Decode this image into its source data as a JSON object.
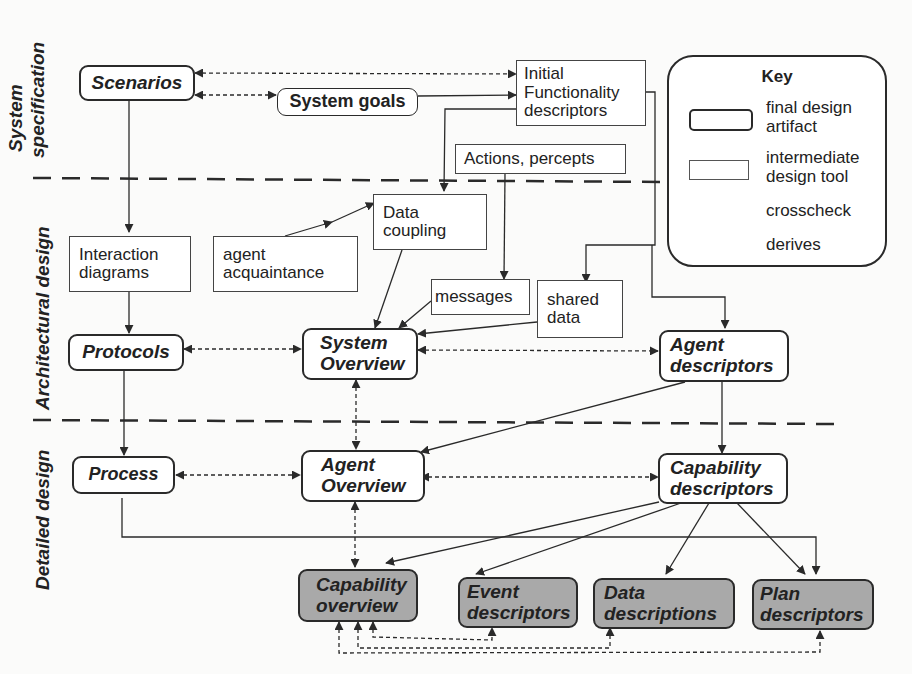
{
  "phases": [
    {
      "id": "system-specification",
      "label_line1": "System",
      "label_line2": "specification"
    },
    {
      "id": "architectural-design",
      "label": "Architectural design"
    },
    {
      "id": "detailed-design",
      "label": "Detailed design"
    }
  ],
  "nodes": {
    "scenarios": {
      "label": "Scenarios",
      "type": "final design artifact"
    },
    "system_goals": {
      "label": "System goals",
      "type": "final design artifact"
    },
    "initial_functionality": {
      "line1": "Initial",
      "line2": "Functionality",
      "line3": "descriptors",
      "type": "intermediate design tool"
    },
    "actions_percepts": {
      "label": "Actions, percepts",
      "type": "intermediate design tool"
    },
    "interaction_diagrams": {
      "line1": "Interaction",
      "line2": "diagrams",
      "type": "intermediate design tool"
    },
    "agent_acquaintance": {
      "line1": "agent",
      "line2": "acquaintance",
      "type": "intermediate design tool"
    },
    "data_coupling": {
      "line1": "Data",
      "line2": "coupling",
      "type": "intermediate design tool"
    },
    "messages": {
      "label": "messages",
      "type": "intermediate design tool"
    },
    "shared_data": {
      "line1": "shared",
      "line2": "data",
      "type": "intermediate design tool"
    },
    "protocols": {
      "label": "Protocols",
      "type": "final design artifact"
    },
    "system_overview": {
      "line1": "System",
      "line2": "Overview",
      "type": "final design artifact"
    },
    "agent_descriptors": {
      "line1": "Agent",
      "line2": "descriptors",
      "type": "final design artifact"
    },
    "process": {
      "label": "Process",
      "type": "final design artifact"
    },
    "agent_overview": {
      "line1": "Agent",
      "line2": "Overview",
      "type": "final design artifact"
    },
    "capability_descriptors": {
      "line1": "Capability",
      "line2": "descriptors",
      "type": "final design artifact"
    },
    "capability_overview": {
      "line1": "Capability",
      "line2": "overview",
      "type": "final design artifact",
      "shaded": true
    },
    "event_descriptors": {
      "line1": "Event",
      "line2": "descriptors",
      "type": "final design artifact",
      "shaded": true
    },
    "data_descriptions": {
      "line1": "Data",
      "line2": "descriptions",
      "type": "final design artifact",
      "shaded": true
    },
    "plan_descriptors": {
      "line1": "Plan",
      "line2": "descriptors",
      "type": "final design artifact",
      "shaded": true
    }
  },
  "key": {
    "title": "Key",
    "final_line1": "final design",
    "final_line2": "artifact",
    "inter_line1": "intermediate",
    "inter_line2": "design tool",
    "crosscheck": "crosscheck",
    "derives": "derives"
  },
  "edges": {
    "derives": [
      [
        "Scenarios",
        "Interaction diagrams"
      ],
      [
        "System goals",
        "Initial Functionality descriptors"
      ],
      [
        "Initial Functionality descriptors",
        "Data coupling"
      ],
      [
        "Initial Functionality descriptors",
        "shared data"
      ],
      [
        "Initial Functionality descriptors",
        "Agent descriptors"
      ],
      [
        "Actions, percepts",
        "messages"
      ],
      [
        "Data coupling",
        "agent acquaintance"
      ],
      [
        "agent acquaintance",
        "Data coupling"
      ],
      [
        "Data coupling",
        "System Overview"
      ],
      [
        "messages",
        "System Overview"
      ],
      [
        "shared data",
        "System Overview"
      ],
      [
        "Interaction diagrams",
        "Protocols"
      ],
      [
        "Protocols",
        "Process"
      ],
      [
        "Agent descriptors",
        "Agent Overview"
      ],
      [
        "Agent descriptors",
        "Capability descriptors"
      ],
      [
        "Process",
        "Plan descriptors"
      ],
      [
        "Capability descriptors",
        "Capability overview"
      ],
      [
        "Capability descriptors",
        "Event descriptors"
      ],
      [
        "Capability descriptors",
        "Data descriptions"
      ],
      [
        "Capability descriptors",
        "Plan descriptors"
      ]
    ],
    "crosscheck": [
      [
        "Scenarios",
        "Initial Functionality descriptors"
      ],
      [
        "Scenarios",
        "System goals"
      ],
      [
        "Protocols",
        "System Overview"
      ],
      [
        "System Overview",
        "Agent descriptors"
      ],
      [
        "System Overview",
        "Agent Overview"
      ],
      [
        "Process",
        "Agent Overview"
      ],
      [
        "Agent Overview",
        "Capability descriptors"
      ],
      [
        "Agent Overview",
        "Capability overview"
      ],
      [
        "Capability overview",
        "Event descriptors"
      ],
      [
        "Capability overview",
        "Data descriptions"
      ],
      [
        "Capability overview",
        "Plan descriptors"
      ]
    ]
  },
  "colors": {
    "line": "#2a2a2a",
    "shaded_fill": "#a9a9a9",
    "background": "#fbfbfa"
  }
}
